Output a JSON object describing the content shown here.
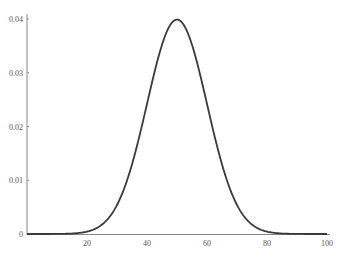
{
  "chart_data": {
    "type": "line",
    "title": "",
    "xlabel": "",
    "ylabel": "",
    "xlim": [
      0,
      100
    ],
    "ylim": [
      0,
      0.04
    ],
    "grid": false,
    "legend": null,
    "x_ticks": [
      "20",
      "40",
      "60",
      "80",
      "100"
    ],
    "y_ticks": [
      "0",
      "0.01",
      "0.02",
      "0.03",
      "0.04"
    ],
    "series": [
      {
        "name": "Normal density (mean 50, sd 10)",
        "mean": 50,
        "sd": 10,
        "x": [
          0,
          10,
          20,
          25,
          30,
          35,
          40,
          45,
          50,
          55,
          60,
          65,
          70,
          75,
          80,
          90,
          100
        ],
        "y": [
          0.0,
          1.34e-05,
          0.000443,
          0.00175,
          0.0054,
          0.01295,
          0.0242,
          0.0352,
          0.0399,
          0.0352,
          0.0242,
          0.01295,
          0.0054,
          0.00175,
          0.000443,
          1.34e-05,
          0.0
        ]
      }
    ],
    "colors": {
      "line": "#3a3a3a",
      "axis": "#888888"
    }
  }
}
